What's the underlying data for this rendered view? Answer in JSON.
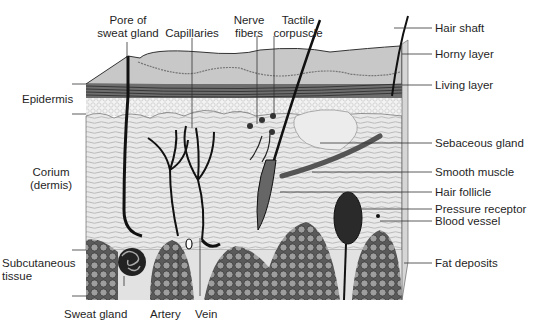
{
  "diagram": {
    "top_labels": [
      {
        "id": "pore-of-sweat-gland",
        "text": "Pore of\nsweat gland",
        "lines": [
          "Pore of",
          "sweat gland"
        ]
      },
      {
        "id": "capillaries",
        "text": "Capillaries",
        "lines": [
          "Capillaries"
        ]
      },
      {
        "id": "nerve-fibers",
        "text": "Nerve\nfibers",
        "lines": [
          "Nerve",
          "fibers"
        ]
      },
      {
        "id": "tactile-corpuscle",
        "text": "Tactile\ncorpuscle",
        "lines": [
          "Tactile",
          "corpuscle"
        ]
      }
    ],
    "right_labels": [
      {
        "id": "hair-shaft",
        "text": "Hair shaft"
      },
      {
        "id": "horny-layer",
        "text": "Horny layer"
      },
      {
        "id": "living-layer",
        "text": "Living layer"
      },
      {
        "id": "sebaceous-gland",
        "text": "Sebaceous gland"
      },
      {
        "id": "smooth-muscle",
        "text": "Smooth muscle"
      },
      {
        "id": "hair-follicle",
        "text": "Hair follicle"
      },
      {
        "id": "pressure-receptor",
        "text": "Pressure receptor"
      },
      {
        "id": "blood-vessel",
        "text": "Blood vessel"
      },
      {
        "id": "fat-deposits",
        "text": "Fat deposits"
      }
    ],
    "left_labels": [
      {
        "id": "epidermis",
        "lines": [
          "Epidermis"
        ]
      },
      {
        "id": "corium",
        "lines": [
          "Corium",
          "(dermis)"
        ]
      },
      {
        "id": "subcutaneous-tissue",
        "lines": [
          "Subcutaneous",
          "tissue"
        ]
      }
    ],
    "bottom_labels": [
      {
        "id": "sweat-gland",
        "text": "Sweat gland"
      },
      {
        "id": "artery",
        "text": "Artery"
      },
      {
        "id": "vein",
        "text": "Vein"
      }
    ]
  }
}
